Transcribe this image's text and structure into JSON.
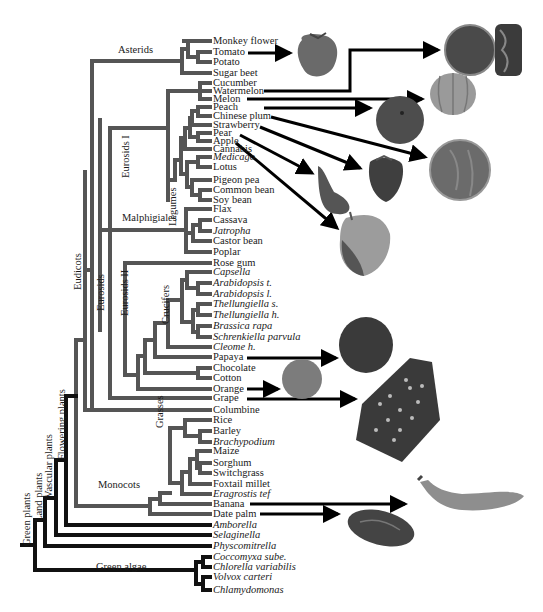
{
  "leaves": [
    {
      "name": "Monkey flower",
      "y": 41,
      "italic": false
    },
    {
      "name": "Tomato",
      "y": 52,
      "italic": false
    },
    {
      "name": "Potato",
      "y": 62,
      "italic": false
    },
    {
      "name": "Sugar beet",
      "y": 73,
      "italic": false
    },
    {
      "name": "Cucumber",
      "y": 83,
      "italic": false
    },
    {
      "name": "Watermelon",
      "y": 91,
      "italic": false
    },
    {
      "name": "Melon",
      "y": 99,
      "italic": false
    },
    {
      "name": "Peach",
      "y": 107,
      "italic": false
    },
    {
      "name": "Chinese plum",
      "y": 116,
      "italic": false
    },
    {
      "name": "Strawberry",
      "y": 125,
      "italic": false
    },
    {
      "name": "Pear",
      "y": 133,
      "italic": false
    },
    {
      "name": "Apple",
      "y": 141,
      "italic": false
    },
    {
      "name": "Cannabis",
      "y": 149,
      "italic": false
    },
    {
      "name": "Medicago",
      "y": 157,
      "italic": true
    },
    {
      "name": "Lotus",
      "y": 167,
      "italic": false
    },
    {
      "name": "Pigeon pea",
      "y": 180,
      "italic": false
    },
    {
      "name": "Common bean",
      "y": 190,
      "italic": false
    },
    {
      "name": "Soy bean",
      "y": 200,
      "italic": false
    },
    {
      "name": "Flax",
      "y": 209,
      "italic": false
    },
    {
      "name": "Cassava",
      "y": 220,
      "italic": false
    },
    {
      "name": "Jatropha",
      "y": 231,
      "italic": true
    },
    {
      "name": "Castor bean",
      "y": 241,
      "italic": false
    },
    {
      "name": "Poplar",
      "y": 252,
      "italic": false
    },
    {
      "name": "Rose gum",
      "y": 263,
      "italic": false
    },
    {
      "name": "Capsella",
      "y": 272,
      "italic": true
    },
    {
      "name": "Arabidopsis t.",
      "y": 283,
      "italic": true
    },
    {
      "name": "Arabidopsis l.",
      "y": 294,
      "italic": true
    },
    {
      "name": "Thellungiella s.",
      "y": 304,
      "italic": true
    },
    {
      "name": "Thellungiella h.",
      "y": 315,
      "italic": true
    },
    {
      "name": "Brassica rapa",
      "y": 326,
      "italic": true
    },
    {
      "name": "Schrenkiella parvula",
      "y": 337,
      "italic": true
    },
    {
      "name": "Cleome h.",
      "y": 347,
      "italic": true
    },
    {
      "name": "Papaya",
      "y": 357,
      "italic": false
    },
    {
      "name": "Chocolate",
      "y": 368,
      "italic": false
    },
    {
      "name": "Cotton",
      "y": 378,
      "italic": false
    },
    {
      "name": "Orange",
      "y": 389,
      "italic": false
    },
    {
      "name": "Grape",
      "y": 398,
      "italic": false
    },
    {
      "name": "Columbine",
      "y": 410,
      "italic": false
    },
    {
      "name": "Rice",
      "y": 420,
      "italic": false
    },
    {
      "name": "Barley",
      "y": 431,
      "italic": false
    },
    {
      "name": "Brachypodium",
      "y": 442,
      "italic": true
    },
    {
      "name": "Maize",
      "y": 451,
      "italic": false
    },
    {
      "name": "Sorghum",
      "y": 463,
      "italic": false
    },
    {
      "name": "Switchgrass",
      "y": 473,
      "italic": false
    },
    {
      "name": "Foxtail millet",
      "y": 484,
      "italic": false
    },
    {
      "name": "Eragrostis tef",
      "y": 494,
      "italic": true
    },
    {
      "name": "Banana",
      "y": 504,
      "italic": false
    },
    {
      "name": "Date palm",
      "y": 514,
      "italic": false
    },
    {
      "name": "Amborella",
      "y": 525,
      "italic": true
    },
    {
      "name": "Selaginella",
      "y": 535,
      "italic": true
    },
    {
      "name": "Physcomitrella",
      "y": 546,
      "italic": true
    },
    {
      "name": "Coccomyxa sube.",
      "y": 557,
      "italic": true
    },
    {
      "name": "Chlorella variabilis",
      "y": 567,
      "italic": true
    },
    {
      "name": "Volvox carteri",
      "y": 577,
      "italic": true
    },
    {
      "name": "Chlamydomonas",
      "y": 590,
      "italic": true
    }
  ],
  "clade_labels": {
    "asterids": "Asterids",
    "eurosids_1": "Eurosids I",
    "legumes": "Legumes",
    "malphigiales": "Malphigiales",
    "eurosids": "Eurosids",
    "eurosids_2": "Eurosids II",
    "crucifers": "Crucifers",
    "eudicots": "Eudicots",
    "grasses": "Grasses",
    "monocots": "Monocots",
    "flowering_plants": "Flowering plants",
    "vascular_plants": "Vascular plants",
    "land_plants": "Land plants",
    "green_plants": "Green plants",
    "green_algae": "Green algae"
  },
  "fruit_images": [
    {
      "fruit": "Tomato",
      "shape": "tomato"
    },
    {
      "fruit": "Watermelon",
      "shape": "watermelon"
    },
    {
      "fruit": "Melon",
      "shape": "melon"
    },
    {
      "fruit": "Peach",
      "shape": "peach"
    },
    {
      "fruit": "Chinese plum",
      "shape": "plum"
    },
    {
      "fruit": "Strawberry",
      "shape": "strawberry"
    },
    {
      "fruit": "Pear",
      "shape": "pear"
    },
    {
      "fruit": "Apple",
      "shape": "apple"
    },
    {
      "fruit": "Papaya",
      "shape": "papaya"
    },
    {
      "fruit": "Orange",
      "shape": "orange"
    },
    {
      "fruit": "Grape",
      "shape": "grape"
    },
    {
      "fruit": "Banana",
      "shape": "banana"
    },
    {
      "fruit": "Date palm",
      "shape": "date"
    }
  ],
  "colors": {
    "eudicot_branch": "#555555",
    "basal_branch": "#111111",
    "arrow": "#000000"
  }
}
